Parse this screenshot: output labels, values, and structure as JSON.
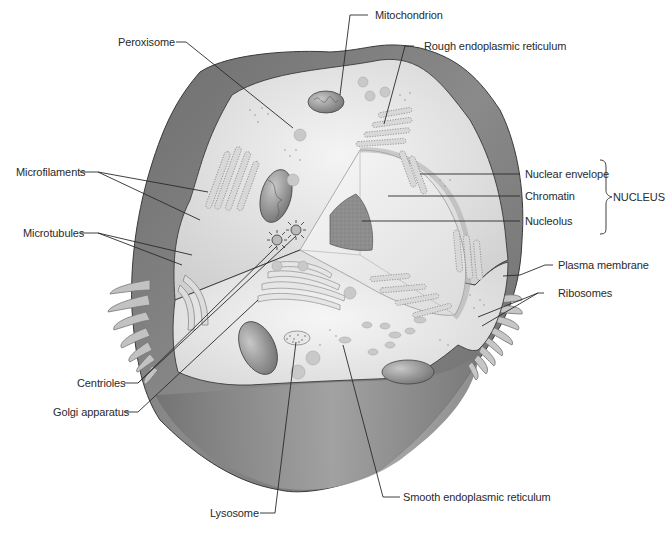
{
  "figure": {
    "type": "animal-cell-cutaway",
    "colors": {
      "outer_surface": "#7c7c7c",
      "cut_surface": "#dcdcdc",
      "cytoplasm_light": "#eeeeee",
      "nucleolus": "#8d8d8d",
      "mitochondrion": "#9a9a9a",
      "label_text": "#2a2a2a"
    }
  },
  "labels": {
    "peroxisome": "Peroxisome",
    "mitochondrion": "Mitochondrion",
    "rough_er": "Rough endoplasmic reticulum",
    "microfilaments": "Microfilaments",
    "microtubules": "Microtubules",
    "nuclear_envelope": "Nuclear envelope",
    "chromatin": "Chromatin",
    "nucleolus": "Nucleolus",
    "nucleus_group": "NUCLEUS",
    "plasma_membrane": "Plasma membrane",
    "ribosomes": "Ribosomes",
    "centrioles": "Centrioles",
    "golgi": "Golgi apparatus",
    "lysosome": "Lysosome",
    "smooth_er": "Smooth endoplasmic reticulum"
  }
}
